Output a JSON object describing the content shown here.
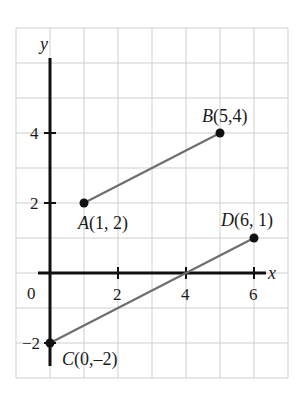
{
  "figure": {
    "type": "coordinate-plane",
    "axes": {
      "x_label": "x",
      "y_label": "y",
      "origin_label": "0",
      "x_ticks": [
        {
          "value": 2,
          "label": "2"
        },
        {
          "value": 4,
          "label": "4"
        },
        {
          "value": 6,
          "label": "6"
        }
      ],
      "y_ticks": [
        {
          "value": 4,
          "label": "4"
        },
        {
          "value": 2,
          "label": "2"
        },
        {
          "value": -2,
          "label": "−2"
        }
      ],
      "grid_x_range": [
        -1,
        7
      ],
      "grid_y_range": [
        -3,
        7
      ]
    },
    "points": {
      "A": {
        "name": "A",
        "coords": "(1, 2)",
        "x": 1,
        "y": 2
      },
      "B": {
        "name": "B",
        "coords": "(5,4)",
        "x": 5,
        "y": 4
      },
      "C": {
        "name": "C",
        "coords": "(0,–2)",
        "x": 0,
        "y": -2
      },
      "D": {
        "name": "D",
        "coords": "(6, 1)",
        "x": 6,
        "y": 1
      }
    },
    "segments": [
      {
        "from": "A",
        "to": "B"
      },
      {
        "from": "C",
        "to": "D"
      }
    ],
    "colors": {
      "grid": "#cfcfcf",
      "axis": "#111111",
      "segment": "#6e6e6e",
      "point": "#111111"
    }
  }
}
